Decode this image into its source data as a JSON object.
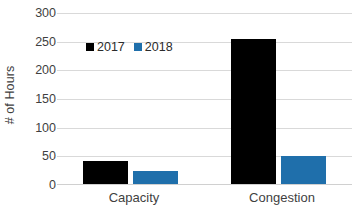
{
  "chart_data": {
    "type": "bar",
    "title": "",
    "xlabel": "",
    "ylabel": "# of Hours",
    "categories": [
      "Capacity",
      "Congestion"
    ],
    "series": [
      {
        "name": "2017",
        "values": [
          41,
          254
        ],
        "color": "#000000"
      },
      {
        "name": "2018",
        "values": [
          23,
          49
        ],
        "color": "#1f6fab"
      }
    ],
    "ylim": [
      0,
      300
    ],
    "yticks": [
      0,
      50,
      100,
      150,
      200,
      250,
      300
    ],
    "ytick_labels": [
      "0",
      "50",
      "100",
      "150",
      "200",
      "250",
      "300"
    ],
    "grid": true,
    "grid_axis": "y",
    "legend_position": "upper-left-inside"
  },
  "axis": {
    "y_title": "# of Hours",
    "y_ticks": [
      "300",
      "250",
      "200",
      "150",
      "100",
      "50",
      "0"
    ],
    "x_categories": [
      "Capacity",
      "Congestion"
    ]
  },
  "legend": {
    "entries": [
      {
        "label": "2017",
        "color": "#000000"
      },
      {
        "label": "2018",
        "color": "#1f6fab"
      }
    ]
  },
  "colors": {
    "series_2017": "#000000",
    "series_2018": "#1f6fab",
    "gridline": "#d9d9d9",
    "text": "#3f3f3f",
    "background": "#ffffff"
  }
}
